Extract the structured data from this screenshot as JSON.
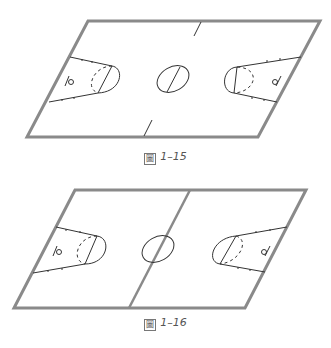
{
  "figures": [
    {
      "id": "fig1",
      "caption": "圖 1–15",
      "caption_glyph": "圖",
      "caption_number": "1–15",
      "description": "Basketball half-court parallelogram diagram with short center tick marks and center circle",
      "colors": {
        "border": "#8a8a8a",
        "lines": "#333333",
        "background": "#ffffff"
      }
    },
    {
      "id": "fig2",
      "caption": "圖 1–16",
      "caption_glyph": "圖",
      "caption_number": "1–16",
      "description": "Basketball court parallelogram diagram with full center line and center circle",
      "colors": {
        "border": "#8a8a8a",
        "lines": "#333333",
        "background": "#ffffff"
      }
    }
  ]
}
